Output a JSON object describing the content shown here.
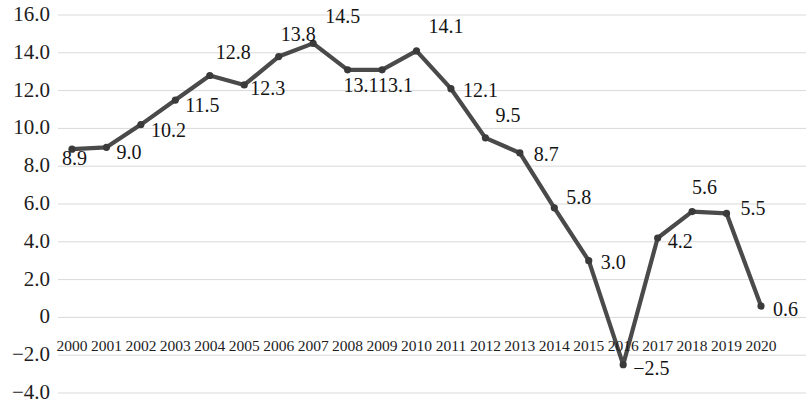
{
  "chart_data": {
    "type": "line",
    "title": "",
    "subtitle": "",
    "xlabel": "",
    "ylabel": "",
    "grid": true,
    "legend": false,
    "legend_position": "none",
    "marker": "circle",
    "line_color": "#4a4a4a",
    "marker_color": "#3a3a3a",
    "grid_color": "#d9d9d9",
    "text_color": "#1d1d1d",
    "categories": [
      "2000",
      "2001",
      "2002",
      "2003",
      "2004",
      "2005",
      "2006",
      "2007",
      "2008",
      "2009",
      "2010",
      "2011",
      "2012",
      "2013",
      "2014",
      "2015",
      "2016",
      "2017",
      "2018",
      "2019",
      "2020"
    ],
    "values": [
      8.9,
      9.0,
      10.2,
      11.5,
      12.8,
      12.3,
      13.8,
      14.5,
      13.1,
      13.1,
      14.1,
      12.1,
      9.5,
      8.7,
      5.8,
      3.0,
      -2.5,
      4.2,
      5.6,
      5.5,
      0.6
    ],
    "point_labels": [
      "8.9",
      "9.0",
      "10.2",
      "11.5",
      "12.8",
      "12.3",
      "13.8",
      "14.5",
      "13.1",
      "13.1",
      "14.1",
      "12.1",
      "9.5",
      "8.7",
      "5.8",
      "3.0",
      "−2.5",
      "4.2",
      "5.6",
      "5.5",
      "0.6"
    ],
    "ylim": [
      -4.0,
      16.0
    ],
    "yticks": [
      16.0,
      14.0,
      12.0,
      10.0,
      8.0,
      6.0,
      4.0,
      2.0,
      0,
      -2.0,
      -4.0
    ],
    "ytick_labels": [
      "16.0",
      "14.0",
      "12.0",
      "10.0",
      "8.0",
      "6.0",
      "4.0",
      "2.0",
      "0",
      "−2.0",
      "−4.0"
    ],
    "xtick_labels": [
      "2000",
      "2001",
      "2002",
      "2003",
      "2004",
      "2005",
      "2006",
      "2007",
      "2008",
      "2009",
      "2010",
      "2011",
      "2012",
      "2013",
      "2014",
      "2015",
      "2016",
      "2017",
      "2018",
      "2019",
      "2020"
    ]
  }
}
